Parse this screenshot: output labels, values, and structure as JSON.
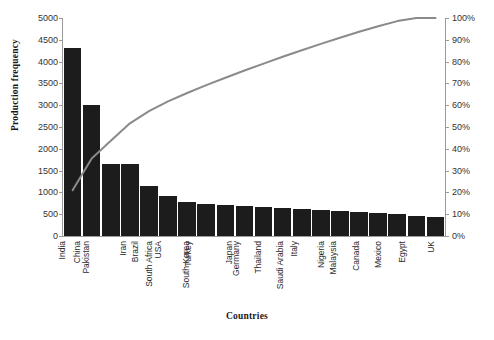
{
  "chart_data": {
    "type": "bar",
    "title": "",
    "subtitle": "",
    "xlabel": "Countries",
    "ylabel": "Production frequency",
    "y2label": "",
    "grid": false,
    "legend": "none",
    "ylim": [
      0,
      5000
    ],
    "y2lim": [
      0,
      100
    ],
    "yticks": [
      0,
      500,
      1000,
      1500,
      2000,
      2500,
      3000,
      3500,
      4000,
      4500,
      5000
    ],
    "ytick_labels": [
      "0",
      "500",
      "1000",
      "1500",
      "2000",
      "2500",
      "3000",
      "3500",
      "4000",
      "4500",
      "5000"
    ],
    "y2ticks": [
      0,
      10,
      20,
      30,
      40,
      50,
      60,
      70,
      80,
      90,
      100
    ],
    "y2tick_labels": [
      "0%",
      "10%",
      "20%",
      "30%",
      "40%",
      "50%",
      "60%",
      "70%",
      "80%",
      "90%",
      "100%"
    ],
    "categories": [
      "India",
      "China",
      "Pakistan",
      "Iran",
      "Brazil",
      "USA",
      "South Africa",
      "Turkey",
      "South Korea",
      "Japan",
      "Germany",
      "Thailand",
      "Italy",
      "Saudi Arabia",
      "Nigeria",
      "Malaysia",
      "Canada",
      "Mexico",
      "Egypt",
      "UK"
    ],
    "values": [
      4320,
      3010,
      1660,
      1650,
      1150,
      920,
      790,
      740,
      700,
      680,
      660,
      640,
      620,
      600,
      580,
      560,
      520,
      500,
      470,
      440
    ],
    "cumulative_percent": [
      21.0,
      35.6,
      43.7,
      51.7,
      57.3,
      61.8,
      65.6,
      69.2,
      72.6,
      75.9,
      79.1,
      82.2,
      85.2,
      88.1,
      90.9,
      93.7,
      96.2,
      98.6,
      100.0,
      100.0
    ],
    "bar_color": "#1c1c1c",
    "line_color": "#8a8a8a",
    "axis_color": "#9a9a9a",
    "background": "#ffffff"
  }
}
